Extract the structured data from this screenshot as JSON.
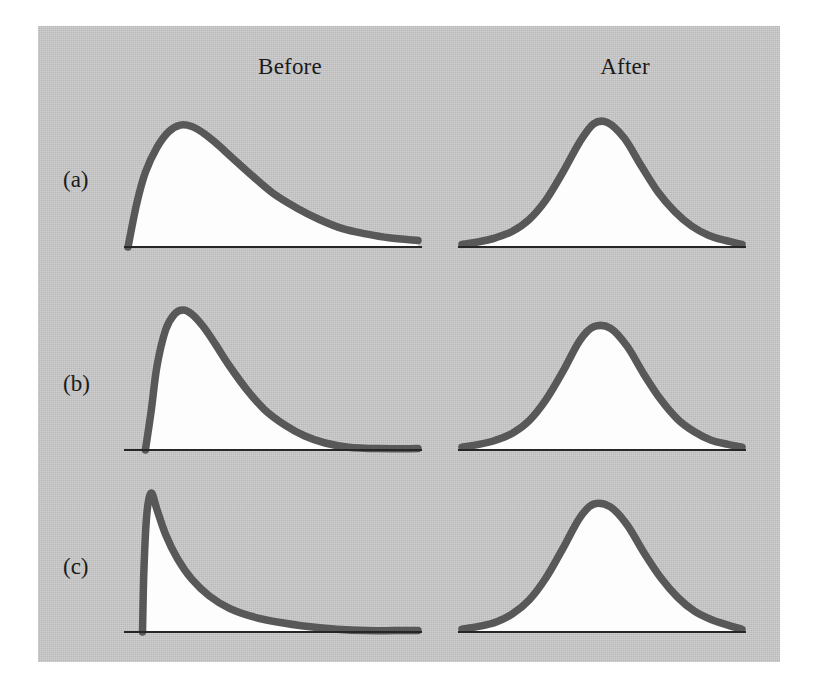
{
  "figure": {
    "plate_color": "#c9c9c9",
    "page_color": "#ffffff",
    "curve_color": "#585858",
    "fill_color": "#fdfdfd",
    "axis_color": "#262626"
  },
  "columns": {
    "before_label": "Before",
    "after_label": "After"
  },
  "rows": [
    {
      "id": "a",
      "label": "(a)"
    },
    {
      "id": "b",
      "label": "(b)"
    },
    {
      "id": "c",
      "label": "(c)"
    }
  ],
  "chart_data": {
    "type": "line",
    "title": "",
    "subtitle": "",
    "xlabel": "",
    "ylabel": "",
    "grid": false,
    "legend": "none",
    "axis_ticks": [],
    "panels": [
      {
        "row": "a",
        "column": "before",
        "shape": "right-skewed unimodal",
        "skewness": "moderate",
        "peak_x_fraction": 0.22,
        "peak_height_fraction": 0.93,
        "x": [
          0.0,
          0.03,
          0.06,
          0.1,
          0.14,
          0.18,
          0.22,
          0.26,
          0.3,
          0.36,
          0.42,
          0.5,
          0.58,
          0.66,
          0.74,
          0.82,
          0.9,
          1.0
        ],
        "y": [
          0.0,
          0.33,
          0.57,
          0.76,
          0.88,
          0.93,
          0.92,
          0.87,
          0.8,
          0.68,
          0.56,
          0.41,
          0.3,
          0.21,
          0.14,
          0.1,
          0.07,
          0.05
        ]
      },
      {
        "row": "a",
        "column": "after",
        "shape": "symmetric bell",
        "skewness": "slight right",
        "peak_x_fraction": 0.5,
        "peak_height_fraction": 0.95,
        "x": [
          0.0,
          0.06,
          0.12,
          0.18,
          0.24,
          0.3,
          0.36,
          0.42,
          0.47,
          0.52,
          0.58,
          0.64,
          0.7,
          0.76,
          0.82,
          0.88,
          0.94,
          1.0
        ],
        "y": [
          0.02,
          0.04,
          0.07,
          0.12,
          0.21,
          0.36,
          0.57,
          0.8,
          0.94,
          0.95,
          0.83,
          0.62,
          0.42,
          0.27,
          0.16,
          0.09,
          0.05,
          0.02
        ]
      },
      {
        "row": "b",
        "column": "before",
        "shape": "right-skewed unimodal",
        "skewness": "strong",
        "peak_x_fraction": 0.19,
        "peak_height_fraction": 1.0,
        "x": [
          0.06,
          0.08,
          0.1,
          0.13,
          0.16,
          0.19,
          0.22,
          0.26,
          0.3,
          0.35,
          0.41,
          0.47,
          0.54,
          0.61,
          0.68,
          0.76,
          0.86,
          1.0
        ],
        "y": [
          0.0,
          0.28,
          0.6,
          0.86,
          0.97,
          1.0,
          0.97,
          0.88,
          0.76,
          0.6,
          0.43,
          0.29,
          0.18,
          0.1,
          0.05,
          0.02,
          0.01,
          0.01
        ]
      },
      {
        "row": "b",
        "column": "after",
        "shape": "symmetric bell",
        "skewness": "none",
        "peak_x_fraction": 0.5,
        "peak_height_fraction": 0.88,
        "x": [
          0.0,
          0.06,
          0.12,
          0.18,
          0.24,
          0.3,
          0.36,
          0.42,
          0.47,
          0.53,
          0.59,
          0.65,
          0.71,
          0.77,
          0.83,
          0.89,
          0.95,
          1.0
        ],
        "y": [
          0.02,
          0.04,
          0.07,
          0.12,
          0.21,
          0.36,
          0.56,
          0.78,
          0.88,
          0.87,
          0.74,
          0.54,
          0.36,
          0.22,
          0.13,
          0.07,
          0.04,
          0.02
        ]
      },
      {
        "row": "c",
        "column": "before",
        "shape": "exponential / extreme right skew",
        "skewness": "extreme",
        "peak_x_fraction": 0.08,
        "peak_height_fraction": 1.0,
        "x": [
          0.05,
          0.055,
          0.065,
          0.08,
          0.1,
          0.13,
          0.17,
          0.22,
          0.28,
          0.35,
          0.43,
          0.52,
          0.62,
          0.72,
          0.82,
          0.92,
          1.0
        ],
        "y": [
          0.0,
          0.45,
          0.85,
          1.0,
          0.88,
          0.7,
          0.53,
          0.38,
          0.26,
          0.17,
          0.11,
          0.07,
          0.04,
          0.02,
          0.01,
          0.01,
          0.01
        ]
      },
      {
        "row": "c",
        "column": "after",
        "shape": "symmetric bell",
        "skewness": "slight right",
        "peak_x_fraction": 0.5,
        "peak_height_fraction": 0.92,
        "x": [
          0.0,
          0.06,
          0.12,
          0.18,
          0.24,
          0.3,
          0.36,
          0.42,
          0.47,
          0.53,
          0.59,
          0.65,
          0.71,
          0.77,
          0.83,
          0.89,
          0.95,
          1.0
        ],
        "y": [
          0.02,
          0.04,
          0.07,
          0.13,
          0.23,
          0.39,
          0.6,
          0.82,
          0.92,
          0.9,
          0.77,
          0.57,
          0.39,
          0.25,
          0.15,
          0.09,
          0.05,
          0.02
        ]
      }
    ]
  }
}
